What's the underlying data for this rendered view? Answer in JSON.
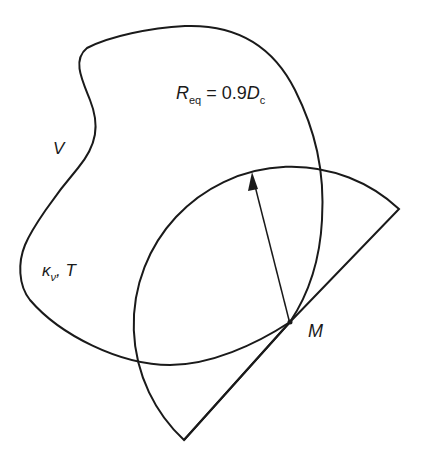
{
  "diagram": {
    "labels": {
      "volume": "V",
      "kappa_symbol": "κ",
      "kappa_sub": "ν",
      "kappa_sep": ",",
      "temperature": "T",
      "req_main": "R",
      "req_sub": "eq",
      "req_equals": "=",
      "req_coeff": "0.9",
      "req_d": "D",
      "req_d_sub": "c",
      "point": "M"
    },
    "colors": {
      "stroke": "#1a1a1a",
      "background": "#ffffff"
    },
    "shapes": {
      "enclosure": "irregular closed curve (gas volume V)",
      "sector": "circular sector centered at M with radius R_eq",
      "arrow": "radius arrow from M to arc"
    }
  }
}
